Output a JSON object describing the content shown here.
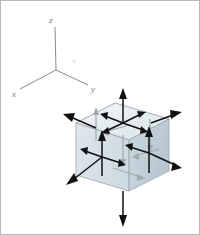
{
  "figure": {
    "type": "engineering-diagram",
    "background_color": "#ffffff",
    "border_color": "#b8b8b8",
    "width": 200,
    "height": 235
  },
  "axes": {
    "name": "coordinate-axes-triad",
    "origin": {
      "x": 55,
      "y": 69
    },
    "labels": {
      "z": "z",
      "x": "x",
      "y": "y",
      "faint": "s"
    },
    "label_positions": {
      "z": {
        "x": 50,
        "y": 20
      },
      "x": {
        "x": 13,
        "y": 94
      },
      "y": {
        "x": 90,
        "y": 89
      },
      "faint": {
        "x": 72,
        "y": 60
      }
    },
    "endpoints": {
      "z": {
        "x": 54,
        "y": 25
      },
      "x": {
        "x": 18,
        "y": 88
      },
      "y": {
        "x": 87,
        "y": 84
      }
    },
    "line_color": "#8a8a8a",
    "label_color": "#7a7a7a"
  },
  "cube": {
    "name": "stress-element-cube",
    "projection": "isometric",
    "top_face_color": "#e8eef1",
    "left_face_color": "#dbe5ea",
    "right_face_color": "#c4d2da",
    "edge_color": "#9aa3a8",
    "hidden_edge_color": "#b9c2c6",
    "vertices": {
      "top_back": {
        "x": 114,
        "y": 102
      },
      "top_left": {
        "x": 75,
        "y": 122
      },
      "top_front": {
        "x": 128,
        "y": 139
      },
      "top_right": {
        "x": 168,
        "y": 118
      },
      "bottom_left": {
        "x": 75,
        "y": 174
      },
      "bottom_front": {
        "x": 128,
        "y": 190
      },
      "bottom_right": {
        "x": 168,
        "y": 170
      }
    }
  },
  "stresses": {
    "description": "Normal and shear stress arrows on each visible cube face",
    "arrow_color": "#111111",
    "hidden_arrow_color": "#9fa9ad",
    "faces": [
      {
        "name": "top-face",
        "normal_direction": "z-positive",
        "center": {
          "x": 122,
          "y": 122
        },
        "normal_arrow": "up",
        "shear_arrows": [
          "left-down",
          "right-down"
        ]
      },
      {
        "name": "bottom-face",
        "normal_direction": "z-negative",
        "center": {
          "x": 122,
          "y": 190
        },
        "normal_arrow": "down",
        "shear_arrows": []
      },
      {
        "name": "left-front-face",
        "normal_direction": "x-negative",
        "center": {
          "x": 101,
          "y": 156
        },
        "normal_arrow": "out-left-down",
        "shear_arrows": [
          "up",
          "right"
        ]
      },
      {
        "name": "right-front-face",
        "normal_direction": "y-positive",
        "center": {
          "x": 148,
          "y": 152
        },
        "normal_arrow": "out-right-down",
        "shear_arrows": [
          "up",
          "left"
        ]
      },
      {
        "name": "back-left-face",
        "normal_direction": "x-positive",
        "center": {
          "x": 95,
          "y": 127
        },
        "normal_arrow": "out-upper-left",
        "shear_arrows": []
      },
      {
        "name": "back-right-face",
        "normal_direction": "y-negative",
        "center": {
          "x": 150,
          "y": 122
        },
        "normal_arrow": "out-upper-right",
        "shear_arrows": []
      }
    ]
  }
}
